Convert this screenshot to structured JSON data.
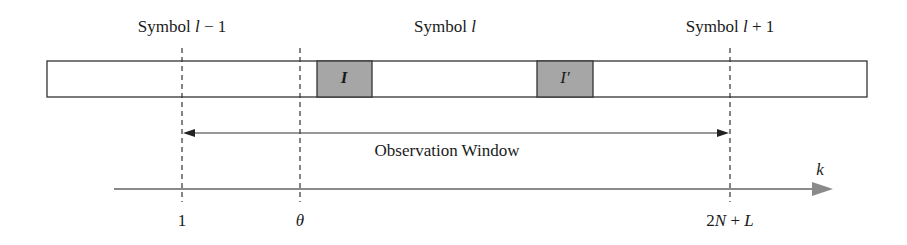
{
  "symbols": [
    {
      "prefix": "Symbol ",
      "var": "l",
      "suffix": " − 1"
    },
    {
      "prefix": "Symbol ",
      "var": "l",
      "suffix": ""
    },
    {
      "prefix": "Symbol ",
      "var": "l",
      "suffix": " + 1"
    }
  ],
  "blocks": [
    {
      "label": "I",
      "color": "#a6a6a6"
    },
    {
      "label": "I′",
      "color": "#a6a6a6"
    }
  ],
  "observation_window": {
    "label": "Observation Window"
  },
  "axis": {
    "variable": "k",
    "ticks": [
      {
        "label": "1"
      },
      {
        "label": "θ"
      },
      {
        "label_num": "2",
        "label_var1": "N",
        "label_mid": " + ",
        "label_var2": "L"
      }
    ],
    "color": "#8a8a8a"
  }
}
